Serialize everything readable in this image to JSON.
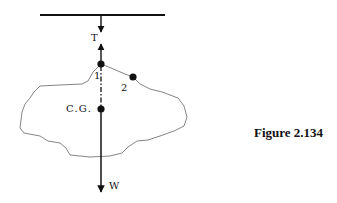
{
  "figure": {
    "caption": "Figure 2.134",
    "labels": {
      "tension": "T",
      "point1": "1",
      "point2": "2",
      "center_of_gravity": "C.G.",
      "weight": "W"
    },
    "colors": {
      "stroke": "#111111",
      "outline": "#777777",
      "background": "#ffffff"
    }
  }
}
